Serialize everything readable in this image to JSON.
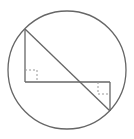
{
  "diagram": {
    "type": "geometry",
    "colors": {
      "stroke": "#666666",
      "marker": "#999999",
      "background": "#ffffff"
    },
    "circle": {
      "cx": 67,
      "cy": 70,
      "r": 59
    },
    "points": {
      "A": {
        "x": 25,
        "y": 29
      },
      "B": {
        "x": 25,
        "y": 82
      },
      "C": {
        "x": 110,
        "y": 82
      },
      "D": {
        "x": 110,
        "y": 111
      }
    },
    "segments": [
      {
        "name": "AB",
        "from": "A",
        "to": "B"
      },
      {
        "name": "BC",
        "from": "B",
        "to": "C"
      },
      {
        "name": "CD",
        "from": "C",
        "to": "D"
      },
      {
        "name": "AD",
        "from": "A",
        "to": "D"
      }
    ],
    "right_angle_markers": [
      {
        "at": "B",
        "x": 25,
        "y": 70,
        "size": 12,
        "orientation": "up-right"
      },
      {
        "at": "C",
        "x": 98,
        "y": 82,
        "size": 12,
        "orientation": "down-left"
      }
    ]
  }
}
